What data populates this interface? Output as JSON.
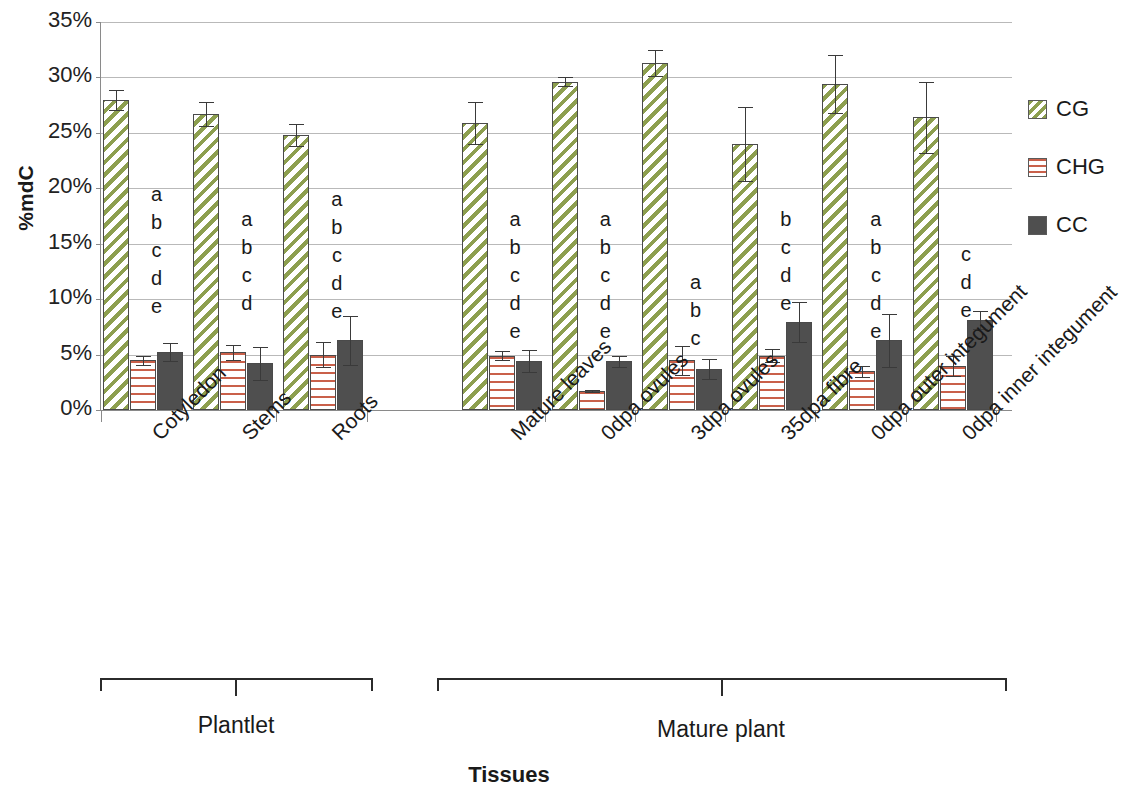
{
  "chart_data": {
    "type": "bar",
    "title": "",
    "xlabel": "Tissues",
    "ylabel": "%mdC",
    "ylim": [
      0,
      35
    ],
    "ytick_labels": [
      "0%",
      "5%",
      "10%",
      "15%",
      "20%",
      "25%",
      "30%",
      "35%"
    ],
    "ytick_values": [
      0,
      5,
      10,
      15,
      20,
      25,
      30,
      35
    ],
    "grid": true,
    "legend_position": "right",
    "categories": [
      "Cotyledon",
      "Stems",
      "Roots",
      "Mature leaves",
      "0dpa ovules",
      "3dpa ovules",
      "35dpa fibre",
      "0dpa outer integument",
      "0dpa inner integument"
    ],
    "series": [
      {
        "name": "CG",
        "color": "#8d9f4f",
        "pattern": "diagonal-stripes",
        "values": [
          28.0,
          26.7,
          24.8,
          25.9,
          29.6,
          31.3,
          24.0,
          29.4,
          26.4
        ],
        "errors": [
          0.9,
          1.1,
          1.0,
          1.9,
          0.4,
          1.2,
          3.3,
          2.6,
          3.2
        ]
      },
      {
        "name": "CHG",
        "color": "#c9604a",
        "pattern": "horizontal-stripes",
        "values": [
          4.5,
          5.2,
          5.0,
          4.9,
          1.7,
          4.5,
          4.9,
          3.5,
          4.0
        ],
        "errors": [
          0.4,
          0.7,
          1.1,
          0.4,
          0.1,
          1.3,
          0.6,
          0.5,
          0.9
        ]
      },
      {
        "name": "CC",
        "color": "#4f4f4f",
        "pattern": "solid",
        "values": [
          5.2,
          4.2,
          6.3,
          4.4,
          4.4,
          3.7,
          7.9,
          6.3,
          8.1
        ],
        "errors": [
          0.8,
          1.5,
          2.2,
          1.0,
          0.5,
          0.9,
          1.8,
          2.4,
          0.8
        ]
      }
    ],
    "significance_letters": [
      [
        "a",
        "b",
        "c",
        "d",
        "e"
      ],
      [
        "a",
        "b",
        "c",
        "d"
      ],
      [
        "a",
        "b",
        "c",
        "d",
        "e"
      ],
      [
        "a",
        "b",
        "c",
        "d",
        "e"
      ],
      [
        "a",
        "b",
        "c",
        "d",
        "e"
      ],
      [
        "a",
        "b",
        "c"
      ],
      [
        "b",
        "c",
        "d",
        "e"
      ],
      [
        "a",
        "b",
        "c",
        "d",
        "e"
      ],
      [
        "c",
        "d",
        "e"
      ]
    ],
    "groups": [
      {
        "label": "Plantlet",
        "categories": [
          "Cotyledon",
          "Stems",
          "Roots"
        ]
      },
      {
        "label": "Mature plant",
        "categories": [
          "Mature leaves",
          "0dpa ovules",
          "3dpa ovules",
          "35dpa fibre",
          "0dpa outer integument",
          "0dpa inner integument"
        ]
      }
    ]
  },
  "axis": {
    "y_title": "%mdC",
    "x_title": "Tissues",
    "y_ticks": [
      "35%",
      "30%",
      "25%",
      "20%",
      "15%",
      "10%",
      "5%",
      "0%"
    ]
  },
  "legend": {
    "items": [
      {
        "label": "CG"
      },
      {
        "label": "CHG"
      },
      {
        "label": "CC"
      }
    ]
  },
  "categories": {
    "c0": "Cotyledon",
    "c1": "Stems",
    "c2": "Roots",
    "c3": "Mature leaves",
    "c4": "0dpa ovules",
    "c5": "3dpa ovules",
    "c6": "35dpa fibre",
    "c7": "0dpa outer integument",
    "c8": "0dpa inner integument"
  },
  "groups": {
    "plantlet": "Plantlet",
    "mature": "Mature plant"
  }
}
